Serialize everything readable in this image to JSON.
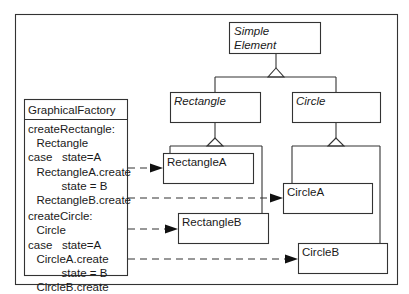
{
  "diagram": {
    "type": "uml-class-diagram",
    "classes": {
      "simple_element": {
        "label_line1": "Simple",
        "label_line2": "Element",
        "abstract": true
      },
      "rectangle": {
        "label": "Rectangle",
        "abstract": true
      },
      "circle": {
        "label": "Circle",
        "abstract": true
      },
      "rectangle_a": {
        "label": "RectangleA"
      },
      "rectangle_b": {
        "label": "RectangleB"
      },
      "circle_a": {
        "label": "CircleA"
      },
      "circle_b": {
        "label": "CircleB"
      }
    },
    "factory": {
      "title": "GraphicalFactory",
      "lines": [
        "createRectangle:",
        "  Rectangle",
        "case   state=A",
        "  RectangleA.create",
        "        state = B",
        "  RectangleB.create",
        "createCircle:",
        "  Circle",
        "case   state=A",
        "  CircleA.create",
        "        state = B",
        "  CircleB.create"
      ]
    },
    "inheritance": [
      {
        "parent": "Simple Element",
        "children": [
          "Rectangle",
          "Circle"
        ]
      },
      {
        "parent": "Rectangle",
        "children": [
          "RectangleA",
          "RectangleB"
        ]
      },
      {
        "parent": "Circle",
        "children": [
          "CircleA",
          "CircleB"
        ]
      }
    ],
    "creates": [
      {
        "from": "RectangleA.create",
        "to": "RectangleA"
      },
      {
        "from": "createCircle",
        "to": "CircleA"
      },
      {
        "from": "CircleA.create",
        "to": "RectangleB"
      },
      {
        "from": "CircleB.create",
        "to": "CircleB"
      }
    ]
  }
}
